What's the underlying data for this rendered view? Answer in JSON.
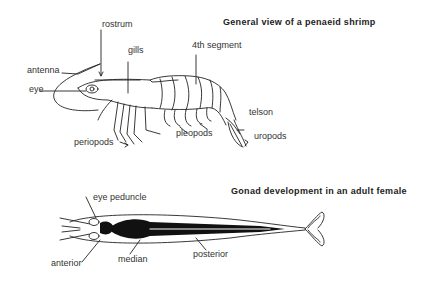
{
  "figure_1": {
    "title": "General view of a penaeid shrimp",
    "labels": {
      "rostrum": "rostrum",
      "gills": "gills",
      "segment": "4th segment",
      "antenna": "antenna",
      "eye": "eye",
      "telson": "telson",
      "uropods": "uropods",
      "pleopods": "pleopods",
      "periopods": "periopods"
    }
  },
  "figure_2": {
    "title": "Gonad development in an adult female",
    "labels": {
      "eye_peduncle": "eye peduncle",
      "anterior": "anterior",
      "median": "median",
      "posterior": "posterior"
    }
  },
  "colors": {
    "ink": "#222222",
    "background": "#ffffff"
  }
}
